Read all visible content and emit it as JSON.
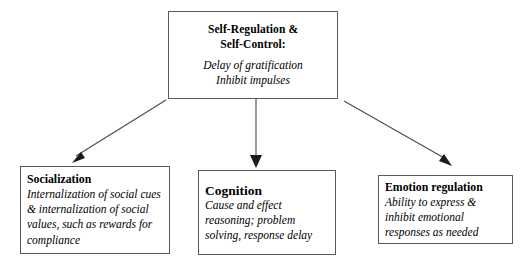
{
  "diagram": {
    "root": {
      "title_line1": "Self-Regulation &",
      "title_line2": "Self-Control:",
      "body_line1": "Delay of gratification",
      "body_line2": "Inhibit impulses"
    },
    "children": [
      {
        "id": "socialization",
        "title": "Socialization",
        "body": "Internalization of social cues & internalization of social values, such as rewards for compliance"
      },
      {
        "id": "cognition",
        "title": "Cognition",
        "body": "Cause and effect reasoning; problem solving, response delay"
      },
      {
        "id": "emotion",
        "title": "Emotion regulation",
        "body": "Ability to express & inhibit emotional responses as needed"
      }
    ],
    "edges": [
      {
        "id": "root-to-socialization",
        "direction": "down-left"
      },
      {
        "id": "root-to-cognition",
        "direction": "down"
      },
      {
        "id": "root-to-emotion",
        "direction": "down-right"
      }
    ],
    "colors": {
      "border": "#595959",
      "line": "#4a4a4a",
      "arrowhead": "#1a1a1a",
      "background": "#ffffff",
      "text": "#000000"
    }
  }
}
